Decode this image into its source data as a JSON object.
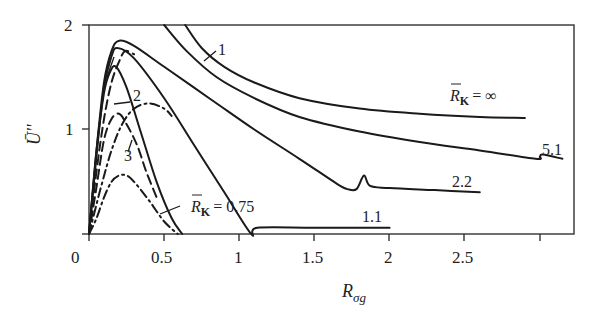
{
  "chart_data": {
    "type": "line",
    "title": "",
    "xlabel": "R_σg",
    "ylabel": "Ū''",
    "xlim": [
      0,
      3.23
    ],
    "ylim": [
      0,
      2
    ],
    "grid": false,
    "legend": "inline curve labels",
    "x_ticks": [
      {
        "value": 0,
        "label": "0"
      },
      {
        "value": 0.5,
        "label": "0.5"
      },
      {
        "value": 1,
        "label": "1"
      },
      {
        "value": 1.5,
        "label": "1.5"
      },
      {
        "value": 2,
        "label": "2"
      },
      {
        "value": 2.5,
        "label": "2.5"
      },
      {
        "value": 3,
        "label": ""
      }
    ],
    "y_ticks": [
      {
        "value": 1,
        "label": "1"
      },
      {
        "value": 2,
        "label": "2"
      }
    ],
    "series": [
      {
        "name": "R̄κ = ∞",
        "style": "solid",
        "x": [
          0.64,
          0.75,
          0.9,
          1.1,
          1.4,
          1.8,
          2.2,
          2.6,
          2.9
        ],
        "y": [
          2.0,
          1.78,
          1.6,
          1.45,
          1.3,
          1.2,
          1.15,
          1.12,
          1.11
        ]
      },
      {
        "name": "R̄κ = 5.1",
        "style": "solid",
        "x": [
          0.5,
          0.65,
          0.85,
          1.1,
          1.4,
          1.8,
          2.2,
          2.6,
          2.97,
          3.0,
          3.02,
          3.15
        ],
        "y": [
          2.0,
          1.75,
          1.5,
          1.3,
          1.12,
          0.98,
          0.88,
          0.8,
          0.72,
          0.74,
          0.76,
          0.72
        ]
      },
      {
        "name": "R̄κ = 2.2",
        "style": "solid",
        "x": [
          0.0,
          0.05,
          0.1,
          0.15,
          0.2,
          0.3,
          0.5,
          0.8,
          1.1,
          1.4,
          1.65,
          1.72,
          1.78,
          1.83,
          1.87,
          2.0,
          2.3,
          2.6
        ],
        "y": [
          0.0,
          0.8,
          1.45,
          1.75,
          1.85,
          1.8,
          1.6,
          1.3,
          1.0,
          0.72,
          0.48,
          0.43,
          0.43,
          0.56,
          0.46,
          0.44,
          0.42,
          0.4
        ]
      },
      {
        "name": "R̄κ = 1.1",
        "style": "solid",
        "x": [
          0.0,
          0.05,
          0.1,
          0.15,
          0.19,
          0.3,
          0.5,
          0.7,
          0.9,
          1.08,
          1.12,
          1.5,
          2.0
        ],
        "y": [
          0.0,
          0.75,
          1.4,
          1.7,
          1.78,
          1.68,
          1.3,
          0.85,
          0.4,
          0.0,
          0.06,
          0.06,
          0.06
        ]
      },
      {
        "name": "R̄κ = 0.75",
        "style": "solid",
        "x": [
          0.0,
          0.05,
          0.1,
          0.14,
          0.18,
          0.25,
          0.35,
          0.45,
          0.55,
          0.62
        ],
        "y": [
          0.0,
          0.8,
          1.35,
          1.55,
          1.6,
          1.4,
          0.95,
          0.5,
          0.15,
          0.0
        ]
      },
      {
        "name": "2 (dashed, upper)",
        "style": "dashed",
        "x": [
          0.0,
          0.05,
          0.1,
          0.15,
          0.2,
          0.24,
          0.3
        ],
        "y": [
          0.0,
          0.6,
          1.1,
          1.45,
          1.65,
          1.75,
          1.72
        ]
      },
      {
        "name": "2 (dashed, lower)",
        "style": "dashed",
        "x": [
          0.0,
          0.05,
          0.1,
          0.15,
          0.2,
          0.25,
          0.32,
          0.38,
          0.45
        ],
        "y": [
          0.0,
          0.45,
          0.9,
          1.1,
          1.15,
          1.05,
          0.85,
          0.6,
          0.35
        ]
      },
      {
        "name": "dash-dot upper",
        "style": "dashdot",
        "x": [
          0.0,
          0.08,
          0.15,
          0.22,
          0.3,
          0.4,
          0.5,
          0.55
        ],
        "y": [
          0.0,
          0.45,
          0.8,
          1.05,
          1.2,
          1.25,
          1.2,
          1.13
        ]
      },
      {
        "name": "3 (dash-dot)",
        "style": "dashdot",
        "x": [
          0.0,
          0.05,
          0.1,
          0.15,
          0.2,
          0.25,
          0.3,
          0.4,
          0.5,
          0.59
        ],
        "y": [
          0.0,
          0.15,
          0.35,
          0.5,
          0.56,
          0.56,
          0.5,
          0.32,
          0.12,
          0.0
        ]
      }
    ],
    "annotations": [
      {
        "text": "1",
        "x": 0.98,
        "y": 1.78
      },
      {
        "text": "2",
        "x": 0.33,
        "y": 1.24
      },
      {
        "text": "3",
        "x": 0.22,
        "y": 0.75
      },
      {
        "text": "R̄κ = ∞",
        "x": 2.45,
        "y": 1.25
      },
      {
        "text": "5.1",
        "x": 3.0,
        "y": 0.82
      },
      {
        "text": "2.2",
        "x": 2.25,
        "y": 0.5
      },
      {
        "text": "1.1",
        "x": 1.62,
        "y": 0.14
      },
      {
        "text": "R̄κ = 0.75",
        "x": 0.75,
        "y": 0.22
      }
    ]
  },
  "labels": {
    "y_axis": "Ū''",
    "x_axis_main": "R",
    "x_axis_sub": "σg",
    "curve_1": "1",
    "curve_2": "2",
    "curve_3": "3",
    "rk_symbol": "R",
    "rk_sub": "K",
    "rk_inf_value": "= ∞",
    "rk_075_value": "= 0.75",
    "val_51": "5.1",
    "val_22": "2.2",
    "val_11": "1.1",
    "xt0": "0",
    "xt05": "0.5",
    "xt1": "1",
    "xt15": "1.5",
    "xt2": "2",
    "xt25": "2.5",
    "yt1": "1",
    "yt2": "2"
  }
}
